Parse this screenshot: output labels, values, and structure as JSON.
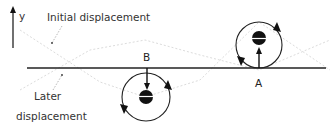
{
  "diagram": {
    "axis": {
      "label": "y"
    },
    "labels": {
      "initial": "Initial displacement",
      "later_line1": "Later",
      "later_line2": "displacement"
    },
    "points": [
      {
        "id": "A",
        "label": "A",
        "arrow_direction": "up",
        "rotation": "clockwise"
      },
      {
        "id": "B",
        "label": "B",
        "arrow_direction": "down",
        "rotation": "clockwise"
      }
    ],
    "colors": {
      "line": "#222222",
      "wave": "#d8d8d8",
      "text": "#333333",
      "ball": "#111111"
    }
  }
}
